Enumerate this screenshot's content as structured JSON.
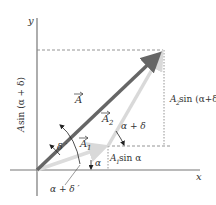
{
  "diagram": {
    "axes": {
      "x_label": "x",
      "y_label": "y"
    },
    "vectors": {
      "A": {
        "label": "A",
        "color": "#666666"
      },
      "A1": {
        "label": "A",
        "subscript": "1",
        "color": "#d9d9d9"
      },
      "A2": {
        "label": "A",
        "subscript": "2",
        "color": "#d9d9d9"
      }
    },
    "angles": {
      "delta_prime": "δ ′",
      "alpha": "α",
      "alpha_plus_delta": "α + δ",
      "alpha_plus_delta_prime": "α + δ ′"
    },
    "projections": {
      "A_sin_alpha_plus_delta": {
        "prefix": "A",
        "text": " sin (α + δ)"
      },
      "A2_sin": {
        "prefix": "A",
        "sub": "2",
        "text": " sin (α+δ)"
      },
      "A1_sin": {
        "prefix": "A",
        "sub": "1",
        "text": " sin α"
      }
    },
    "colors": {
      "axis": "#777777",
      "dashed": "#888888",
      "text": "#333333"
    }
  }
}
